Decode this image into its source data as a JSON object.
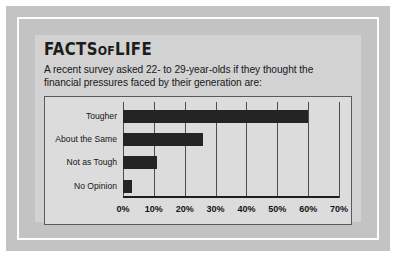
{
  "card": {
    "title": {
      "part1": "FACTS",
      "part2": "OF",
      "part3": "LIFE"
    },
    "subtitle_line1": "A recent survey asked 22- to 29-year-olds if they thought the",
    "subtitle_line2": "financial pressures faced by their generation are:"
  },
  "colors": {
    "bar": "#242426",
    "plot_background": "#dcdcdc",
    "card_background": "#d2d2d2",
    "frame_band": "#c3c3c3",
    "gridline": "#4d4d4f",
    "axis": "#1d1d1f",
    "text": "#141416"
  },
  "chart_data": {
    "type": "bar",
    "orientation": "horizontal",
    "title": "",
    "xlabel": "",
    "ylabel": "",
    "categories": [
      "Tougher",
      "About the Same",
      "Not as Tough",
      "No Opinion"
    ],
    "values": [
      60,
      26,
      11,
      3
    ],
    "value_unit": "%",
    "xlim": [
      0,
      70
    ],
    "xticks": [
      0,
      10,
      20,
      30,
      40,
      50,
      60,
      70
    ],
    "xtick_labels": [
      "0%",
      "10%",
      "20%",
      "30%",
      "40%",
      "50%",
      "60%",
      "70%"
    ],
    "grid": true,
    "grid_axis": "x",
    "legend": false
  }
}
